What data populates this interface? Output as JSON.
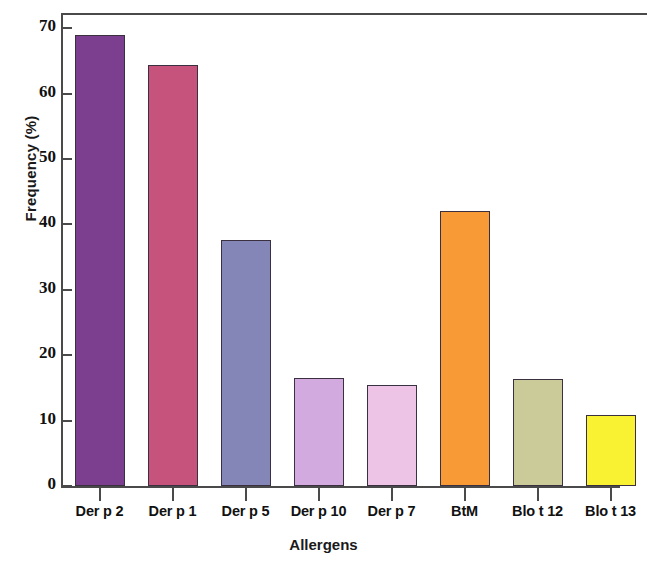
{
  "chart_data": {
    "type": "bar",
    "title": "",
    "xlabel": "Allergens",
    "ylabel": "Frequency (%)",
    "categories": [
      "Der p 2",
      "Der p 1",
      "Der p 5",
      "Der p 10",
      "Der p 7",
      "BtM",
      "Blo t 12",
      "Blo t 13"
    ],
    "values": [
      69,
      64.3,
      37.6,
      16.5,
      15.5,
      42,
      16.4,
      10.9
    ],
    "bar_colors": [
      "#7C3F8F",
      "#C5537B",
      "#8386B6",
      "#D2AADF",
      "#EEC4E6",
      "#F89A36",
      "#CBCB99",
      "#F9F233"
    ],
    "bar_edge_color": "#3b3040",
    "ylim": [
      0,
      72
    ],
    "xlim": [
      0,
      8
    ],
    "yticks": [
      0,
      10,
      20,
      30,
      40,
      50,
      60,
      70
    ],
    "ytick_labels": [
      "0",
      "10",
      "20",
      "30",
      "40",
      "50",
      "60",
      "70"
    ],
    "grid": false,
    "legend": null,
    "axis_color": "#4a4a4a",
    "background_color": "#ffffff",
    "frame": "top-left-bottom"
  },
  "axes": {
    "y_title": "Frequency (%)",
    "x_title": "Allergens"
  }
}
